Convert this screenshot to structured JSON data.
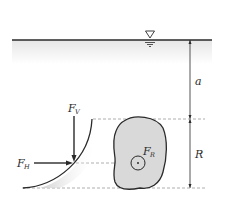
{
  "diagram": {
    "labels": {
      "a": "a",
      "R": "R",
      "fv_main": "F",
      "fv_sub": "V",
      "fh_main": "F",
      "fh_sub": "H",
      "fr_main": "F",
      "fr_sub": "R"
    },
    "symbols": {
      "free_surface": "free-surface-triangle"
    },
    "colors": {
      "line": "#2a2a2a",
      "water_shade": "#ececec",
      "body_fill": "#d9d9d9",
      "dashed": "#9a9a9a"
    }
  }
}
